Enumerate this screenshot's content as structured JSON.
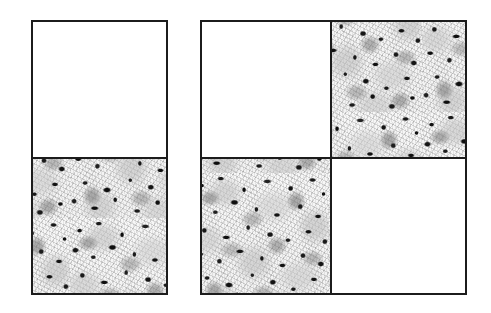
{
  "figure": {
    "background_color": "#ffffff",
    "border_color": "#1c1c1c",
    "border_width_px": 2,
    "texture_name": "grayscale-speckle-noise",
    "texture_base_color": "#f4f4f4",
    "texture_speck_color": "#111111",
    "blank_fill_color": "#ffffff",
    "canvas": {
      "width": 491,
      "height": 313
    }
  },
  "panels": [
    {
      "id": "left-panel",
      "name": "left-panel",
      "label": "",
      "x": 31,
      "y": 20,
      "width": 137,
      "height": 275,
      "subdivision": "horizontal-half",
      "divider_y_offset": 135,
      "cells": [
        {
          "id": "left-top",
          "name": "left-panel-top-cell",
          "fill": "blank",
          "label": "",
          "x": 0,
          "y": 0,
          "width": 133,
          "height": 135
        },
        {
          "id": "left-bottom",
          "name": "left-panel-bottom-cell",
          "fill": "textured",
          "label": "",
          "x": 0,
          "y": 135,
          "width": 133,
          "height": 136
        }
      ]
    },
    {
      "id": "right-panel",
      "name": "right-panel",
      "label": "",
      "x": 200,
      "y": 20,
      "width": 267,
      "height": 275,
      "subdivision": "quadrants",
      "divider_x_offset": 128,
      "divider_y_offset": 135,
      "cells": [
        {
          "id": "right-top-left",
          "name": "right-panel-top-left-cell",
          "fill": "blank",
          "label": "",
          "x": 0,
          "y": 0,
          "width": 128,
          "height": 135
        },
        {
          "id": "right-top-right",
          "name": "right-panel-top-right-cell",
          "fill": "textured",
          "label": "",
          "x": 130,
          "y": 0,
          "width": 133,
          "height": 135
        },
        {
          "id": "right-bottom-left",
          "name": "right-panel-bottom-left-cell",
          "fill": "textured",
          "label": "",
          "x": 0,
          "y": 137,
          "width": 128,
          "height": 134
        },
        {
          "id": "right-bottom-right",
          "name": "right-panel-bottom-right-cell",
          "fill": "blank",
          "label": "",
          "x": 130,
          "y": 137,
          "width": 133,
          "height": 134
        }
      ]
    }
  ],
  "annotations": [],
  "legend": {
    "visible": false,
    "entries": []
  }
}
